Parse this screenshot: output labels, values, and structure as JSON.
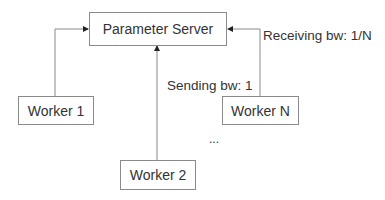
{
  "diagram": {
    "nodes": [
      {
        "id": "ps",
        "label": "Parameter Server"
      },
      {
        "id": "w1",
        "label": "Worker 1"
      },
      {
        "id": "w2",
        "label": "Worker 2"
      },
      {
        "id": "wn",
        "label": "Worker N"
      }
    ],
    "edges": [
      {
        "from": "w1",
        "to": "ps"
      },
      {
        "from": "w2",
        "to": "ps"
      },
      {
        "from": "wn",
        "to": "ps"
      }
    ],
    "annotations": {
      "receiving": "Receiving bw: 1/N",
      "sending": "Sending bw: 1",
      "ellipsis": "..."
    },
    "colors": {
      "line": "#8a8a8a",
      "text": "#333333"
    }
  }
}
